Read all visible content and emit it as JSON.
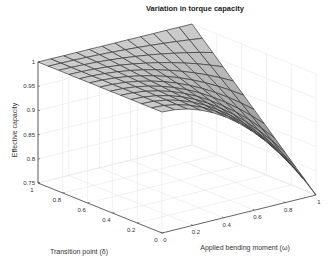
{
  "chart_data": {
    "type": "surface3d",
    "title": "Variation in torque capacity",
    "xlabel": "Applied bending moment (ω)",
    "ylabel": "Transition point (δ)",
    "zlabel": "Effective capacity",
    "x_ticks": [
      "0",
      "0.2",
      "0.4",
      "0.6",
      "0.8",
      "1"
    ],
    "y_ticks": [
      "0",
      "0.2",
      "0.4",
      "0.6",
      "0.8",
      "1"
    ],
    "z_ticks": [
      "0.75",
      "0.8",
      "0.85",
      "0.9",
      "0.95",
      "1"
    ],
    "xlim": [
      0,
      1
    ],
    "ylim": [
      0,
      1
    ],
    "zlim": [
      0.75,
      1
    ],
    "grid": true,
    "mesh_divisions": 12,
    "surface_description": "z = 1 - 0.25 * omega^2 * (1 - delta); z=1 along omega=0 and at (omega=1, delta=1); minimum 0.75 at (omega=1, delta=0)",
    "corner_values": [
      {
        "omega": 0,
        "delta": 0,
        "z": 1.0
      },
      {
        "omega": 0,
        "delta": 1,
        "z": 1.0
      },
      {
        "omega": 1,
        "delta": 1,
        "z": 1.0
      },
      {
        "omega": 1,
        "delta": 0,
        "z": 0.75
      }
    ],
    "surface_color": "#b8b8b8",
    "edge_color": "#3a3a3a"
  }
}
